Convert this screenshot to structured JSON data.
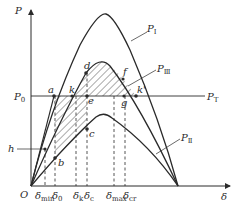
{
  "diagram": {
    "type": "power-angle characteristic (equal area criterion)",
    "axes": {
      "y_label": "P",
      "x_label": "δ",
      "origin_label": "O"
    },
    "curves": [
      {
        "id": "P_I",
        "label": "P",
        "subscript": "Ⅰ",
        "description": "pre-fault power curve"
      },
      {
        "id": "P_II",
        "label": "P",
        "subscript": "Ⅱ",
        "description": "fault power curve"
      },
      {
        "id": "P_III",
        "label": "P",
        "subscript": "Ⅲ",
        "description": "post-fault power curve"
      }
    ],
    "horizontal_line": {
      "left_label": "P",
      "left_subscript": "0",
      "right_label": "P",
      "right_subscript": "T"
    },
    "points": [
      "a",
      "b",
      "c",
      "d",
      "e",
      "f",
      "g",
      "k",
      "k'",
      "h"
    ],
    "x_ticks": [
      {
        "sym": "δ",
        "sub": "min"
      },
      {
        "sym": "δ",
        "sub": "0"
      },
      {
        "sym": "δ",
        "sub": "k"
      },
      {
        "sym": "δ",
        "sub": "c"
      },
      {
        "sym": "δ",
        "sub": "max"
      },
      {
        "sym": "δ",
        "sub": "cr"
      }
    ],
    "shaded_regions": [
      "acceleration area (a-k-e-c-b)",
      "deceleration area (k-d-f-k')"
    ],
    "colors": {
      "line": "#2a2a2a",
      "background": "#ffffff"
    }
  }
}
